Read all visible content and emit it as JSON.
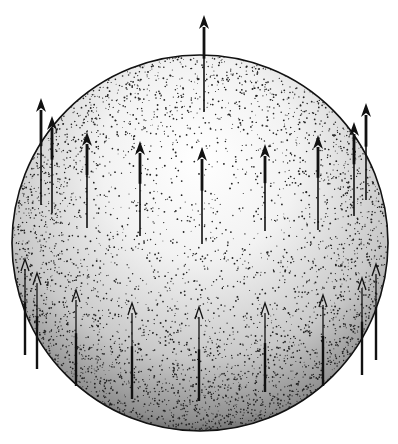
{
  "figure": {
    "width": 398,
    "height": 444,
    "background": "#ffffff",
    "ink_color": "#111111",
    "sphere": {
      "cx": 200,
      "cy": 243,
      "r": 188,
      "shading": "stipple",
      "light_from": "upper-center"
    },
    "arrows": {
      "direction": "up",
      "top_single": {
        "x": 204,
        "y_tip": 15,
        "y_tail": 112,
        "style": "bold"
      },
      "upper_row": [
        {
          "x": 41,
          "y_tip": 98,
          "y_tail": 205,
          "style": "bold"
        },
        {
          "x": 52,
          "y_tip": 116,
          "y_tail": 213,
          "style": "bold"
        },
        {
          "x": 87,
          "y_tip": 132,
          "y_tail": 228,
          "style": "bold"
        },
        {
          "x": 140,
          "y_tip": 141,
          "y_tail": 236,
          "style": "bold"
        },
        {
          "x": 202,
          "y_tip": 147,
          "y_tail": 244,
          "style": "bold"
        },
        {
          "x": 265,
          "y_tip": 144,
          "y_tail": 231,
          "style": "bold"
        },
        {
          "x": 318,
          "y_tip": 135,
          "y_tail": 230,
          "style": "bold"
        },
        {
          "x": 354,
          "y_tip": 122,
          "y_tail": 216,
          "style": "bold"
        },
        {
          "x": 366,
          "y_tip": 103,
          "y_tail": 200,
          "style": "bold"
        }
      ],
      "lower_row": [
        {
          "x": 25,
          "y_tip": 259,
          "y_tail": 355,
          "style": "thin"
        },
        {
          "x": 37,
          "y_tip": 273,
          "y_tail": 369,
          "style": "thin"
        },
        {
          "x": 76,
          "y_tip": 290,
          "y_tail": 386,
          "style": "thin"
        },
        {
          "x": 132,
          "y_tip": 303,
          "y_tail": 399,
          "style": "thin"
        },
        {
          "x": 199,
          "y_tip": 307,
          "y_tail": 401,
          "style": "thin"
        },
        {
          "x": 265,
          "y_tip": 303,
          "y_tail": 392,
          "style": "thin"
        },
        {
          "x": 323,
          "y_tip": 295,
          "y_tail": 386,
          "style": "thin"
        },
        {
          "x": 362,
          "y_tip": 278,
          "y_tail": 375,
          "style": "thin"
        },
        {
          "x": 376,
          "y_tip": 264,
          "y_tail": 360,
          "style": "thin"
        }
      ]
    }
  }
}
